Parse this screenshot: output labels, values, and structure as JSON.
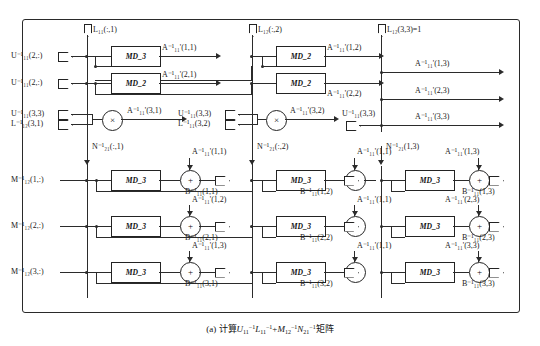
{
  "figure": {
    "caption_prefix": "(a)",
    "caption_text": "计算",
    "caption_suffix": "矩阵",
    "caption_formula": "U11^-1 L11^-1 + M12^-1 N21^-1"
  },
  "top_inputs": [
    {
      "name": "L11-col1",
      "label": "L₁₁(:,1)"
    },
    {
      "name": "L12-col2",
      "label": "L₁₂(:,2)"
    },
    {
      "name": "L12-33",
      "label": "L₁₂(3,3)=1"
    }
  ],
  "upper_section": {
    "left_inputs": [
      {
        "label": "U⁻¹₁₁(2,:)"
      },
      {
        "label": "U⁻¹₁₁(2,:)"
      },
      {
        "label": "U⁻¹₁₁(3,3)"
      },
      {
        "label": "L⁻¹₁₂(3,1)"
      }
    ],
    "blocks": [
      {
        "label": "MD_3",
        "out": "A⁻¹₁₁'(1,1)"
      },
      {
        "label": "MD_2",
        "out": "A⁻¹₁₁'(2,1)"
      },
      {
        "label": "MD_2",
        "out": "A⁻¹₁₁'(1,2)"
      },
      {
        "label": "MD_2",
        "out": "A⁻¹₁₁'(2,2)"
      }
    ],
    "multipliers": [
      {
        "symbol": "×",
        "out": "A⁻¹₁₁'(3,1)"
      },
      {
        "symbol": "×",
        "out": "A⁻¹₁₁'(3,2)"
      }
    ],
    "mid_inputs": [
      {
        "label": "U⁻¹₁₁(3,3)"
      },
      {
        "label": "L⁻¹₁₁(3,2)"
      }
    ],
    "right_input": {
      "label": "U⁻¹₁₁(3,3)"
    },
    "right_outputs": [
      {
        "label": "A⁻¹₁₁'(1,3)"
      },
      {
        "label": "A⁻¹₁₁'(2,3)"
      },
      {
        "label": "A⁻¹₁₁'(3,3)"
      }
    ]
  },
  "lower_section": {
    "left_inputs": [
      {
        "label": "M⁻¹₁₂(1,:)"
      },
      {
        "label": "M⁻¹₁₂(2,:)"
      },
      {
        "label": "M⁻¹₁₂(3,:)"
      }
    ],
    "column_feeds": [
      {
        "label": "N⁻¹₂₁(:,1)"
      },
      {
        "label": "N⁻¹₂₁(:,2)"
      },
      {
        "label": "N⁻¹₂₁(1,3)"
      }
    ],
    "block_label": "MD_3",
    "adder_symbol": "+",
    "cells": [
      {
        "a_in": "A⁻¹₁₁'(1,1)",
        "out": "B⁻¹₁₁(1,1)",
        "row": 1,
        "col": 1
      },
      {
        "a_in": "A⁻¹₁₁'(1,1)",
        "out": "B⁻¹₁₁(1,2)",
        "row": 1,
        "col": 2
      },
      {
        "a_in": "A⁻¹₁₁'(1,3)",
        "out": "B⁻¹₁₁(1,3)",
        "row": 1,
        "col": 3
      },
      {
        "a_in": "A⁻¹₁₁'(1,2)",
        "out": "B⁻¹₁₁(2,1)",
        "row": 2,
        "col": 1
      },
      {
        "a_in": "A⁻¹₁₁'(1,1)",
        "out": "B⁻¹₁₁(2,2)",
        "row": 2,
        "col": 2
      },
      {
        "a_in": "A⁻¹₁₁'(2,3)",
        "out": "B⁻¹₁₁(2,3)",
        "row": 2,
        "col": 3
      },
      {
        "a_in": "A⁻¹₁₁'(1,3)",
        "out": "B⁻¹₁₁(3,1)",
        "row": 3,
        "col": 1
      },
      {
        "a_in": "A⁻¹₁₁'(1,1)",
        "out": "B⁻¹₁₁(3,2)",
        "row": 3,
        "col": 2
      },
      {
        "a_in": "A⁻¹₁₁'(3,3)",
        "out": "B⁻¹₁₁(3,3)",
        "row": 3,
        "col": 3
      }
    ]
  },
  "colors": {
    "ink": "#2b2b2b",
    "background": "#ffffff"
  }
}
